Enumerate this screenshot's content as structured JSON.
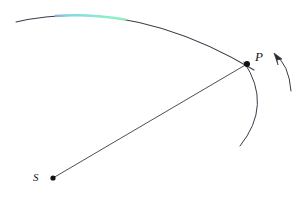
{
  "figure": {
    "title": "",
    "background_color": "#ffffff",
    "width": 306,
    "height": 201,
    "stroke_color": "#3a3a4a",
    "point_color": "#111111"
  },
  "labels": {
    "source_point": "S",
    "field_point": "P"
  },
  "elements": {
    "primary_wavefront_name": "primary-wavefront-arc",
    "ray_name": "ray-s-to-p",
    "secondary_wavelet_name": "secondary-wavelet-arc",
    "direction_arrow_name": "propagation-direction-arrow",
    "source_dot_name": "source-point-dot",
    "field_dot_name": "field-point-dot"
  },
  "geometry": {
    "source_point": {
      "x": 53,
      "y": 178
    },
    "field_point": {
      "x": 247,
      "y": 64
    },
    "primary_arc": {
      "start": {
        "x": 16,
        "y": 22
      },
      "control": {
        "x": 130,
        "y": -4
      },
      "end": {
        "x": 254,
        "y": 70
      }
    },
    "secondary_arc": {
      "start": {
        "x": 244,
        "y": 62
      },
      "control": {
        "x": 272,
        "y": 104
      },
      "end": {
        "x": 240,
        "y": 146
      }
    },
    "direction_arrow": {
      "tail": {
        "x": 291,
        "y": 91
      },
      "control": {
        "x": 288,
        "y": 63
      },
      "head": {
        "x": 274,
        "y": 54
      }
    }
  },
  "spectrum_band": {
    "name": "dispersion-color-band",
    "x_start": 55,
    "x_end": 126,
    "stops": [
      {
        "offset": "0%",
        "color": "#c9a9d4"
      },
      {
        "offset": "8%",
        "color": "#c060b0"
      },
      {
        "offset": "22%",
        "color": "#7fd8e8"
      },
      {
        "offset": "40%",
        "color": "#8ff0c8"
      },
      {
        "offset": "58%",
        "color": "#8de89a"
      },
      {
        "offset": "74%",
        "color": "#cfe6c0"
      },
      {
        "offset": "86%",
        "color": "#c060b0"
      },
      {
        "offset": "100%",
        "color": "#cbb0d6"
      }
    ]
  },
  "colors": {
    "line": "#3a3a4a",
    "dot": "#111111",
    "text": "#1a1a1a",
    "magenta": "#c060b0",
    "cyan": "#7fd8e8",
    "green": "#8de89a"
  }
}
